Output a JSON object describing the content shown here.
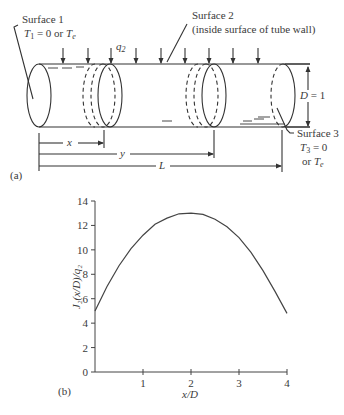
{
  "diagram": {
    "panel_label": "(a)",
    "surface1": {
      "title": "Surface 1",
      "condition_T": "T",
      "condition_sub": "1",
      "condition_rest": " = 0 or ",
      "condition_Te": "T",
      "condition_Te_sub": "e"
    },
    "surface2": {
      "title": "Surface 2",
      "subtitle": "(inside surface of tube wall)"
    },
    "surface3": {
      "title": "Surface 3",
      "line2_T": "T",
      "line2_sub": "3",
      "line2_rest": " = 0",
      "line3_pre": "or ",
      "line3_T": "T",
      "line3_sub": "e"
    },
    "heat_flux_label": "q",
    "heat_flux_sub": "2",
    "diameter_label": "D = 1",
    "dim_x": "x",
    "dim_y": "y",
    "dim_L": "L"
  },
  "chart": {
    "panel_label": "(b)",
    "y_axis_label": "J₂(x/D)/q₂",
    "x_axis_label": "x/D",
    "y_ticks": [
      "0",
      "2",
      "4",
      "6",
      "8",
      "10",
      "12",
      "14"
    ],
    "x_ticks": [
      "1",
      "2",
      "3",
      "4"
    ]
  },
  "chart_data": {
    "type": "line",
    "title": "",
    "xlabel": "x/D",
    "ylabel": "J2(x/D)/q2",
    "xlim": [
      0,
      4
    ],
    "ylim": [
      0,
      14
    ],
    "grid": false,
    "legend": null,
    "series": [
      {
        "name": "J2(x/D)/q2",
        "x": [
          0,
          0.25,
          0.5,
          0.75,
          1.0,
          1.25,
          1.5,
          1.75,
          2.0,
          2.25,
          2.5,
          2.75,
          3.0,
          3.25,
          3.5,
          3.75,
          4.0
        ],
        "y": [
          5.0,
          7.0,
          8.7,
          10.1,
          11.2,
          12.1,
          12.6,
          12.95,
          13.0,
          12.9,
          12.5,
          11.9,
          11.0,
          9.8,
          8.3,
          6.6,
          4.8
        ]
      }
    ],
    "x_ticks": [
      1,
      2,
      3,
      4
    ],
    "y_ticks": [
      0,
      2,
      4,
      6,
      8,
      10,
      12,
      14
    ]
  }
}
